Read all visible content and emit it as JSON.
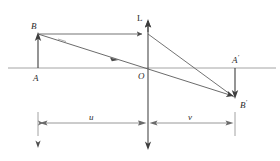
{
  "diagram": {
    "type": "thin-lens-ray-diagram",
    "stroke_color": "#4d4d4d",
    "axis_color": "#8c8c8c",
    "label_color": "#2b2b2b",
    "background": "#ffffff"
  },
  "labels": {
    "lens_axis": "L",
    "object_top": "B",
    "object_base": "A",
    "optical_center": "O",
    "image_base": "A",
    "image_base_prime": "′",
    "image_top": "B",
    "image_top_prime": "′",
    "object_distance": "u",
    "image_distance": "v"
  },
  "geometry": {
    "optical_axis": {
      "x1": 8,
      "y1": 68,
      "x2": 276,
      "y2": 68
    },
    "lens_line": {
      "x": 148,
      "y_top": 20,
      "y_bottom": 148
    },
    "object_arrow": {
      "x": 38,
      "y_base": 68,
      "y_tip": 34
    },
    "image_arrow": {
      "x": 235,
      "y_base": 68,
      "y_tip": 98
    },
    "ray_parallel": {
      "x1": 38,
      "y1": 34,
      "x2": 148,
      "y2": 34
    },
    "ray_refracted": {
      "x1": 148,
      "y1": 34,
      "x2": 235,
      "y2": 98
    },
    "ray_through_center": {
      "x1": 38,
      "y1": 34,
      "x2": 235,
      "y2": 98
    },
    "dimension_line_y": 123,
    "dimension_ticks": [
      38,
      148,
      235
    ]
  },
  "measurements": {
    "u_label": "u",
    "u_span": {
      "from": 38,
      "to": 148
    },
    "v_label": "v",
    "v_span": {
      "from": 148,
      "to": 235
    }
  }
}
